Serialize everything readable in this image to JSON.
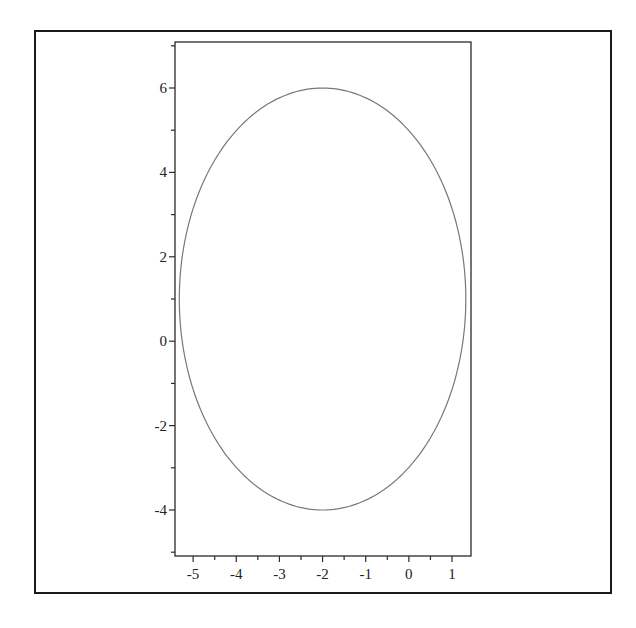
{
  "chart_data": {
    "type": "line",
    "title": "",
    "xlabel": "",
    "ylabel": "",
    "xlim": [
      -5.42,
      1.44
    ],
    "ylim": [
      -5.09,
      7.09
    ],
    "grid": false,
    "legend": null,
    "x_ticks": [
      -5,
      -4,
      -3,
      -2,
      -1,
      0,
      1
    ],
    "x_tick_labels": [
      "-5",
      "-4",
      "-3",
      "-2",
      "-1",
      "0",
      "1"
    ],
    "x_minor_ticks": [
      -4.5,
      -3.5,
      -2.5,
      -1.5,
      -0.5,
      0.5
    ],
    "y_ticks": [
      -4,
      -2,
      0,
      2,
      4,
      6
    ],
    "y_tick_labels": [
      "-4",
      "-2",
      "0",
      "2",
      "4",
      "6"
    ],
    "y_minor_ticks": [
      -5,
      -3,
      -1,
      1,
      3,
      5,
      7
    ],
    "series": [
      {
        "name": "ellipse",
        "shape": "ellipse",
        "center": [
          -2,
          1
        ],
        "semi_axis_x": 3.32,
        "semi_axis_y": 5,
        "x_extent": [
          -5.32,
          1.32
        ],
        "y_extent": [
          -4,
          6
        ],
        "color": "#777777"
      }
    ]
  },
  "layout": {
    "frame": {
      "left": 35,
      "top": 31,
      "right": 611,
      "bottom": 593
    },
    "plot": {
      "left": 175,
      "top": 42,
      "right": 471,
      "bottom": 556
    }
  }
}
